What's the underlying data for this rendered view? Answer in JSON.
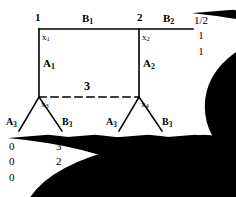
{
  "diagram": {
    "type": "tree-graph-with-vectors",
    "title": "",
    "nodes": [
      {
        "id": "n1",
        "label": "1",
        "x": 37,
        "y": 22
      },
      {
        "id": "n2",
        "label": "2",
        "x": 139,
        "y": 22
      }
    ],
    "variables": [
      {
        "id": "x1",
        "base": "x",
        "sub": "1"
      },
      {
        "id": "x2",
        "base": "x",
        "sub": "2"
      },
      {
        "id": "x3",
        "base": "x",
        "sub": "3"
      },
      {
        "id": "x4",
        "base": "x",
        "sub": "4"
      }
    ],
    "edges": [
      {
        "id": "B1",
        "base": "B",
        "sub": "1",
        "kind": "horizontal"
      },
      {
        "id": "B2",
        "base": "B",
        "sub": "2",
        "kind": "horizontal"
      },
      {
        "id": "A1",
        "base": "A",
        "sub": "1",
        "kind": "vertical"
      },
      {
        "id": "A2",
        "base": "A",
        "sub": "2",
        "kind": "vertical"
      },
      {
        "id": "A3L",
        "base": "A",
        "sub": "3",
        "kind": "branch"
      },
      {
        "id": "B3L",
        "base": "B",
        "sub": "3",
        "kind": "branch"
      },
      {
        "id": "A3R",
        "base": "A",
        "sub": "3",
        "kind": "branch"
      },
      {
        "id": "B3R",
        "base": "B",
        "sub": "3",
        "kind": "branch"
      }
    ],
    "dashed_edge": {
      "label": "3",
      "style": "dashed"
    },
    "vectors": [
      {
        "id": "vec-top-right",
        "values": [
          "1/2",
          "1",
          "1"
        ]
      },
      {
        "id": "vec-leaf-1",
        "values": [
          "0",
          "0",
          "0"
        ]
      },
      {
        "id": "vec-leaf-2",
        "values": [
          "3",
          "2",
          "2"
        ]
      },
      {
        "id": "vec-leaf-3",
        "values": [
          "0",
          "0",
          "1"
        ]
      },
      {
        "id": "vec-leaf-4",
        "values": [
          "4",
          "4",
          "0"
        ]
      }
    ],
    "colors": {
      "stroke": "#000000",
      "background": "#ffffff"
    }
  }
}
